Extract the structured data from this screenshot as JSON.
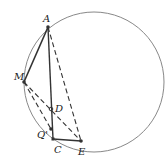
{
  "diagram": {
    "type": "geometry",
    "circle": {
      "cx": 94,
      "cy": 82,
      "r": 70,
      "stroke": "#888888"
    },
    "points": {
      "A": {
        "label": "A",
        "x": 48,
        "y": 27,
        "lx": 43,
        "ly": 22
      },
      "M": {
        "label": "M",
        "x": 24,
        "y": 82,
        "lx": 14,
        "ly": 80
      },
      "D": {
        "label": "D",
        "x": 51,
        "y": 109,
        "lx": 55,
        "ly": 112
      },
      "Q": {
        "label": "Q'",
        "x": 51,
        "y": 129,
        "lx": 37,
        "ly": 138
      },
      "C": {
        "label": "C",
        "x": 53,
        "y": 139,
        "lx": 54,
        "ly": 152
      },
      "E": {
        "label": "E",
        "x": 81,
        "y": 141,
        "lx": 78,
        "ly": 155
      }
    },
    "solid_segments": [
      [
        "A",
        "M"
      ],
      [
        "A",
        "C"
      ],
      [
        "C",
        "E"
      ]
    ],
    "dashed_segments": [
      [
        "A",
        "E"
      ],
      [
        "M",
        "Q"
      ],
      [
        "M",
        "E"
      ]
    ],
    "colors": {
      "line": "#333333",
      "circle": "#888888"
    }
  }
}
